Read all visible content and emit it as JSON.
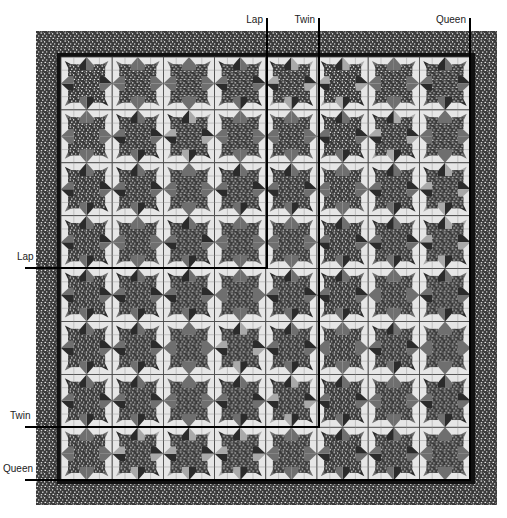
{
  "diagram": {
    "type": "quilt-layout",
    "grid": {
      "columns": 8,
      "rows": 8
    },
    "colors": {
      "background": "#ffffff",
      "block_background": "#e6e6e6",
      "grid_line": "#444444",
      "star_solid": "#6f6f6f",
      "star_dark": "#2b2b2b",
      "star_light": "#a9a9a9",
      "speckle_dark": "#3a3a3a",
      "speckle_light": "#d8d8d8",
      "inner_border": "#111111",
      "marker_line": "#000000"
    },
    "block_patterns": [
      [
        "M",
        "S",
        "S",
        "M",
        "L",
        "L",
        "S",
        "M"
      ],
      [
        "S",
        "M",
        "L",
        "S",
        "S",
        "M",
        "L",
        "S"
      ],
      [
        "M",
        "M",
        "S",
        "M",
        "M",
        "S",
        "M",
        "L"
      ],
      [
        "M",
        "S",
        "M",
        "S",
        "S",
        "M",
        "M",
        "L"
      ],
      [
        "M",
        "M",
        "M",
        "S",
        "M",
        "M",
        "S",
        "M"
      ],
      [
        "M",
        "M",
        "S",
        "L",
        "M",
        "S",
        "M",
        "S"
      ],
      [
        "M",
        "M",
        "S",
        "M",
        "L",
        "M",
        "S",
        "M"
      ],
      [
        "S",
        "L",
        "L",
        "L",
        "S",
        "M",
        "M",
        "S"
      ]
    ],
    "size_markers": [
      {
        "name": "Lap",
        "top_label": "Lap",
        "side_label": "Lap",
        "vertical_x": 267,
        "horizontal_y": 268
      },
      {
        "name": "Twin",
        "top_label": "Twin",
        "side_label": "Twin",
        "vertical_x": 319,
        "horizontal_y": 427
      },
      {
        "name": "Queen",
        "top_label": "Queen",
        "side_label": "Queen",
        "vertical_x": 470,
        "horizontal_y": 480
      }
    ]
  }
}
